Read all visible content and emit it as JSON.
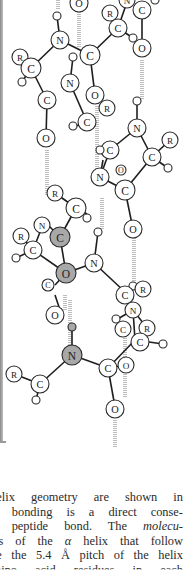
{
  "figure": {
    "colors": {
      "atom_fill": "#ffffff",
      "atom_highlight_fill": "#a8a8a8",
      "atom_stroke": "#2a2a2a",
      "bond": "#1e1e1e",
      "hbond": "#bdbdbd",
      "frame": "#9a9a9a",
      "text": "#2b2b2b"
    },
    "hbonds": [
      {
        "x1": 79,
        "y1": 0,
        "x2": 79,
        "y2": 47
      },
      {
        "x1": 142,
        "y1": 60,
        "x2": 142,
        "y2": 100
      },
      {
        "x1": 97,
        "y1": 106,
        "x2": 97,
        "y2": 170
      },
      {
        "x1": 47,
        "y1": 150,
        "x2": 47,
        "y2": 195
      },
      {
        "x1": 102,
        "y1": 198,
        "x2": 102,
        "y2": 229
      },
      {
        "x1": 134,
        "y1": 236,
        "x2": 134,
        "y2": 286
      },
      {
        "x1": 70,
        "y1": 345,
        "x2": 70,
        "y2": 300
      },
      {
        "x1": 125,
        "y1": 330,
        "x2": 125,
        "y2": 398
      },
      {
        "x1": 115,
        "y1": 420,
        "x2": 115,
        "y2": 448
      },
      {
        "x1": 65,
        "y1": 295,
        "x2": 65,
        "y2": 310
      },
      {
        "x1": 58,
        "y1": 0,
        "x2": 58,
        "y2": 10
      }
    ],
    "bonds": [
      {
        "x1": 60,
        "y1": 40,
        "x2": 57,
        "y2": 16
      },
      {
        "x1": 60,
        "y1": 40,
        "x2": 90,
        "y2": 55
      },
      {
        "x1": 60,
        "y1": 40,
        "x2": 31,
        "y2": 68
      },
      {
        "x1": 90,
        "y1": 55,
        "x2": 118,
        "y2": 28
      },
      {
        "x1": 90,
        "y1": 55,
        "x2": 95,
        "y2": 95
      },
      {
        "x1": 31,
        "y1": 68,
        "x2": 20,
        "y2": 57
      },
      {
        "x1": 31,
        "y1": 68,
        "x2": 22,
        "y2": 82
      },
      {
        "x1": 31,
        "y1": 68,
        "x2": 47,
        "y2": 100
      },
      {
        "x1": 47,
        "y1": 100,
        "x2": 46,
        "y2": 138
      },
      {
        "x1": 70,
        "y1": 83,
        "x2": 73,
        "y2": 57
      },
      {
        "x1": 70,
        "y1": 83,
        "x2": 87,
        "y2": 122
      },
      {
        "x1": 87,
        "y1": 122,
        "x2": 73,
        "y2": 127
      },
      {
        "x1": 118,
        "y1": 28,
        "x2": 133,
        "y2": 38
      },
      {
        "x1": 118,
        "y1": 28,
        "x2": 127,
        "y2": 2
      },
      {
        "x1": 142,
        "y1": 10,
        "x2": 142,
        "y2": 48
      },
      {
        "x1": 137,
        "y1": 128,
        "x2": 137,
        "y2": 101
      },
      {
        "x1": 137,
        "y1": 128,
        "x2": 152,
        "y2": 157
      },
      {
        "x1": 137,
        "y1": 128,
        "x2": 110,
        "y2": 150
      },
      {
        "x1": 152,
        "y1": 157,
        "x2": 170,
        "y2": 140
      },
      {
        "x1": 152,
        "y1": 157,
        "x2": 168,
        "y2": 168
      },
      {
        "x1": 152,
        "y1": 157,
        "x2": 125,
        "y2": 190
      },
      {
        "x1": 110,
        "y1": 150,
        "x2": 100,
        "y2": 150
      },
      {
        "x1": 100,
        "y1": 177,
        "x2": 110,
        "y2": 150
      },
      {
        "x1": 100,
        "y1": 177,
        "x2": 125,
        "y2": 190
      },
      {
        "x1": 100,
        "y1": 177,
        "x2": 103,
        "y2": 160
      },
      {
        "x1": 125,
        "y1": 190,
        "x2": 133,
        "y2": 229
      },
      {
        "x1": 76,
        "y1": 208,
        "x2": 55,
        "y2": 193
      },
      {
        "x1": 76,
        "y1": 208,
        "x2": 60,
        "y2": 237
      },
      {
        "x1": 76,
        "y1": 208,
        "x2": 87,
        "y2": 214
      },
      {
        "x1": 60,
        "y1": 237,
        "x2": 43,
        "y2": 220
      },
      {
        "x1": 60,
        "y1": 237,
        "x2": 66,
        "y2": 273
      },
      {
        "x1": 66,
        "y1": 273,
        "x2": 94,
        "y2": 263
      },
      {
        "x1": 66,
        "y1": 273,
        "x2": 55,
        "y2": 285
      },
      {
        "x1": 33,
        "y1": 250,
        "x2": 42,
        "y2": 227
      },
      {
        "x1": 33,
        "y1": 250,
        "x2": 21,
        "y2": 236
      },
      {
        "x1": 33,
        "y1": 250,
        "x2": 16,
        "y2": 258
      },
      {
        "x1": 33,
        "y1": 250,
        "x2": 66,
        "y2": 273
      },
      {
        "x1": 94,
        "y1": 263,
        "x2": 98,
        "y2": 232
      },
      {
        "x1": 94,
        "y1": 263,
        "x2": 125,
        "y2": 292
      },
      {
        "x1": 125,
        "y1": 292,
        "x2": 140,
        "y2": 287
      },
      {
        "x1": 125,
        "y1": 292,
        "x2": 133,
        "y2": 310
      },
      {
        "x1": 133,
        "y1": 310,
        "x2": 116,
        "y2": 320
      },
      {
        "x1": 133,
        "y1": 310,
        "x2": 147,
        "y2": 328
      },
      {
        "x1": 133,
        "y1": 310,
        "x2": 135,
        "y2": 340
      },
      {
        "x1": 135,
        "y1": 340,
        "x2": 163,
        "y2": 344
      },
      {
        "x1": 135,
        "y1": 340,
        "x2": 108,
        "y2": 368
      },
      {
        "x1": 108,
        "y1": 368,
        "x2": 126,
        "y2": 365
      },
      {
        "x1": 72,
        "y1": 355,
        "x2": 72,
        "y2": 328
      },
      {
        "x1": 72,
        "y1": 355,
        "x2": 108,
        "y2": 368
      },
      {
        "x1": 72,
        "y1": 355,
        "x2": 40,
        "y2": 384
      },
      {
        "x1": 40,
        "y1": 384,
        "x2": 14,
        "y2": 374
      },
      {
        "x1": 40,
        "y1": 384,
        "x2": 36,
        "y2": 400
      },
      {
        "x1": 108,
        "y1": 368,
        "x2": 115,
        "y2": 407
      },
      {
        "x1": 55,
        "y1": 295,
        "x2": 60,
        "y2": 310
      }
    ],
    "atoms": [
      {
        "el": "O",
        "x": 79,
        "y": 3,
        "r": 9
      },
      {
        "el": "N",
        "x": 127,
        "y": 0,
        "r": 8
      },
      {
        "el": "C",
        "x": 142,
        "y": 10,
        "r": 9
      },
      {
        "el": "",
        "x": 155,
        "y": 0,
        "r": 4
      },
      {
        "el": "R",
        "x": 110,
        "y": 13,
        "r": 8
      },
      {
        "el": "C",
        "x": 118,
        "y": 28,
        "r": 9
      },
      {
        "el": "",
        "x": 133,
        "y": 38,
        "r": 4
      },
      {
        "el": "O",
        "x": 142,
        "y": 48,
        "r": 9
      },
      {
        "el": "",
        "x": 57,
        "y": 16,
        "r": 4
      },
      {
        "el": "N",
        "x": 60,
        "y": 40,
        "r": 9
      },
      {
        "el": "C",
        "x": 90,
        "y": 55,
        "r": 10
      },
      {
        "el": "R",
        "x": 20,
        "y": 57,
        "r": 8
      },
      {
        "el": "C",
        "x": 31,
        "y": 68,
        "r": 10
      },
      {
        "el": "",
        "x": 22,
        "y": 82,
        "r": 4
      },
      {
        "el": "",
        "x": 73,
        "y": 57,
        "r": 4
      },
      {
        "el": "N",
        "x": 70,
        "y": 83,
        "r": 9
      },
      {
        "el": "O",
        "x": 95,
        "y": 95,
        "r": 9
      },
      {
        "el": "R",
        "x": 107,
        "y": 108,
        "r": 8
      },
      {
        "el": "C",
        "x": 47,
        "y": 100,
        "r": 9
      },
      {
        "el": "C",
        "x": 87,
        "y": 122,
        "r": 9
      },
      {
        "el": "",
        "x": 73,
        "y": 126,
        "r": 4
      },
      {
        "el": "O",
        "x": 46,
        "y": 138,
        "r": 9
      },
      {
        "el": "",
        "x": 137,
        "y": 101,
        "r": 4
      },
      {
        "el": "N",
        "x": 137,
        "y": 128,
        "r": 9
      },
      {
        "el": "R",
        "x": 170,
        "y": 140,
        "r": 8
      },
      {
        "el": "C",
        "x": 110,
        "y": 150,
        "r": 9
      },
      {
        "el": "",
        "x": 100,
        "y": 150,
        "r": 4
      },
      {
        "el": "C",
        "x": 152,
        "y": 157,
        "r": 9
      },
      {
        "el": "",
        "x": 168,
        "y": 168,
        "r": 4
      },
      {
        "el": "N",
        "x": 100,
        "y": 177,
        "r": 9
      },
      {
        "el": "O",
        "x": 121,
        "y": 170,
        "r": 5,
        "small": true
      },
      {
        "el": "C",
        "x": 125,
        "y": 190,
        "r": 10
      },
      {
        "el": "R",
        "x": 55,
        "y": 193,
        "r": 8
      },
      {
        "el": "C",
        "x": 76,
        "y": 208,
        "r": 10
      },
      {
        "el": "",
        "x": 87,
        "y": 218,
        "r": 4
      },
      {
        "el": "O",
        "x": 133,
        "y": 229,
        "r": 9
      },
      {
        "el": "N",
        "x": 42,
        "y": 225,
        "r": 8
      },
      {
        "el": "C",
        "x": 60,
        "y": 237,
        "r": 10,
        "highlight": true
      },
      {
        "el": "R",
        "x": 21,
        "y": 236,
        "r": 8
      },
      {
        "el": "C",
        "x": 33,
        "y": 250,
        "r": 9
      },
      {
        "el": "",
        "x": 16,
        "y": 258,
        "r": 4
      },
      {
        "el": "",
        "x": 98,
        "y": 232,
        "r": 4
      },
      {
        "el": "N",
        "x": 94,
        "y": 263,
        "r": 9
      },
      {
        "el": "O",
        "x": 66,
        "y": 273,
        "r": 10,
        "highlight": true
      },
      {
        "el": "C",
        "x": 48,
        "y": 285,
        "r": 6,
        "small": true
      },
      {
        "el": "",
        "x": 133,
        "y": 286,
        "r": 4
      },
      {
        "el": "R",
        "x": 143,
        "y": 289,
        "r": 8
      },
      {
        "el": "C",
        "x": 125,
        "y": 295,
        "r": 9
      },
      {
        "el": "",
        "x": 116,
        "y": 319,
        "r": 4
      },
      {
        "el": "N",
        "x": 133,
        "y": 310,
        "r": 8
      },
      {
        "el": "C",
        "x": 123,
        "y": 329,
        "r": 8
      },
      {
        "el": "R",
        "x": 147,
        "y": 328,
        "r": 8
      },
      {
        "el": "O",
        "x": 55,
        "y": 315,
        "r": 9
      },
      {
        "el": "C",
        "x": 140,
        "y": 342,
        "r": 9
      },
      {
        "el": "",
        "x": 163,
        "y": 344,
        "r": 4
      },
      {
        "el": "O",
        "x": 126,
        "y": 365,
        "r": 8
      },
      {
        "el": "",
        "x": 72,
        "y": 327,
        "r": 4,
        "highlight": true
      },
      {
        "el": "N",
        "x": 72,
        "y": 355,
        "r": 10,
        "highlight": true
      },
      {
        "el": "C",
        "x": 108,
        "y": 368,
        "r": 9
      },
      {
        "el": "R",
        "x": 14,
        "y": 374,
        "r": 8
      },
      {
        "el": "C",
        "x": 40,
        "y": 384,
        "r": 9
      },
      {
        "el": "",
        "x": 36,
        "y": 400,
        "r": 4
      },
      {
        "el": "O",
        "x": 115,
        "y": 409,
        "r": 9
      }
    ]
  },
  "caption": {
    "lines": [
      "-helix geometry are shown in",
      "en bonding is a direct conse-",
      "ar peptide bond.  The molecu-",
      "ons of the α helix that follow",
      "ure the 5.4 Å pitch of the helix",
      "  amino acid residues in each"
    ],
    "line3_plain": "ar peptide bond.  The ",
    "line3_italic": "molecu-",
    "line4_pre": "ons of the ",
    "line4_italic": "α",
    "line4_post": " helix that follow"
  }
}
